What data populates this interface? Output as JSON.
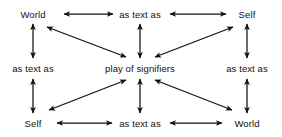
{
  "diagram": {
    "background_color": "#ffffff",
    "stroke_color": "#111111",
    "text_color": "#111111",
    "nodes": [
      {
        "id": "top-left",
        "label": "World",
        "x": 33,
        "y": 14
      },
      {
        "id": "top-center",
        "label": "as text as",
        "x": 140,
        "y": 14
      },
      {
        "id": "top-right",
        "label": "Self",
        "x": 247,
        "y": 14
      },
      {
        "id": "middle-left",
        "label": "as text as",
        "x": 33,
        "y": 68
      },
      {
        "id": "center",
        "label": "play of signifiers",
        "x": 140,
        "y": 68
      },
      {
        "id": "middle-right",
        "label": "as text as",
        "x": 247,
        "y": 68
      },
      {
        "id": "bottom-left",
        "label": "Self",
        "x": 33,
        "y": 123
      },
      {
        "id": "bottom-center",
        "label": "as text as",
        "x": 140,
        "y": 123
      },
      {
        "id": "bottom-right",
        "label": "World",
        "x": 247,
        "y": 123
      }
    ],
    "connectors": [
      {
        "id": "top-left-to-top-center",
        "kind": "horizontal-double-arrow",
        "x1": 64,
        "y1": 14,
        "x2": 113,
        "y2": 14
      },
      {
        "id": "top-center-to-top-right",
        "kind": "horizontal-double-arrow",
        "x1": 170,
        "y1": 14,
        "x2": 226,
        "y2": 14
      },
      {
        "id": "bottom-left-to-bottom-center",
        "kind": "horizontal-double-arrow",
        "x1": 57,
        "y1": 123,
        "x2": 112,
        "y2": 123
      },
      {
        "id": "bottom-center-to-bottom-right",
        "kind": "horizontal-double-arrow",
        "x1": 170,
        "y1": 123,
        "x2": 222,
        "y2": 123
      },
      {
        "id": "top-left-to-middle-left",
        "kind": "vertical-double-arrow",
        "x1": 33,
        "y1": 24,
        "x2": 33,
        "y2": 58
      },
      {
        "id": "middle-left-to-bottom-left",
        "kind": "vertical-double-arrow",
        "x1": 33,
        "y1": 79,
        "x2": 33,
        "y2": 113
      },
      {
        "id": "top-right-to-middle-right",
        "kind": "vertical-double-arrow",
        "x1": 247,
        "y1": 24,
        "x2": 247,
        "y2": 58
      },
      {
        "id": "middle-right-to-bottom-right",
        "kind": "vertical-double-arrow",
        "x1": 247,
        "y1": 79,
        "x2": 247,
        "y2": 113
      },
      {
        "id": "top-center-to-center",
        "kind": "vertical-double-arrow",
        "x1": 140,
        "y1": 24,
        "x2": 140,
        "y2": 58
      },
      {
        "id": "center-to-bottom-center",
        "kind": "vertical-double-arrow",
        "x1": 140,
        "y1": 79,
        "x2": 140,
        "y2": 113
      },
      {
        "id": "center-to-top-left",
        "kind": "diagonal-double-arrow",
        "x1": 126,
        "y1": 57,
        "x2": 47,
        "y2": 27
      },
      {
        "id": "center-to-top-right",
        "kind": "diagonal-double-arrow",
        "x1": 155,
        "y1": 57,
        "x2": 233,
        "y2": 27
      },
      {
        "id": "center-to-bottom-left",
        "kind": "diagonal-double-arrow",
        "x1": 126,
        "y1": 80,
        "x2": 49,
        "y2": 110
      },
      {
        "id": "center-to-bottom-right",
        "kind": "diagonal-double-arrow",
        "x1": 155,
        "y1": 80,
        "x2": 232,
        "y2": 110
      }
    ]
  }
}
